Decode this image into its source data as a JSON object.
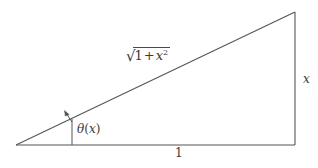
{
  "figure": {
    "kind": "right-triangle-diagram",
    "background_color": "#ffffff",
    "stroke_color": "#555555",
    "text_color": "#3a3a3a",
    "width": 318,
    "height": 168
  },
  "labels": {
    "hypotenuse": {
      "name": "sqrt-one-plus-x-squared",
      "radicand_first": "1",
      "operator": "+",
      "radicand_second": "x",
      "exponent": "2",
      "plain_text": "√(1 + x²)"
    },
    "angle": {
      "name": "theta-of-x",
      "symbol": "θ",
      "open_paren": "(",
      "argument": "x",
      "close_paren": ")",
      "plain_text": "θ(x)"
    },
    "vertical_side": {
      "name": "opposite-side",
      "text": "x"
    },
    "base_side": {
      "name": "adjacent-side",
      "text": "1"
    }
  },
  "geometry": {
    "left_vertex": [
      16,
      145
    ],
    "bottom_right_vertex": [
      295,
      145
    ],
    "top_right_vertex": [
      295,
      12
    ],
    "angle_tick_x": 72,
    "angle_tick_top_y": 118,
    "angle_tick_bottom_y": 145
  }
}
